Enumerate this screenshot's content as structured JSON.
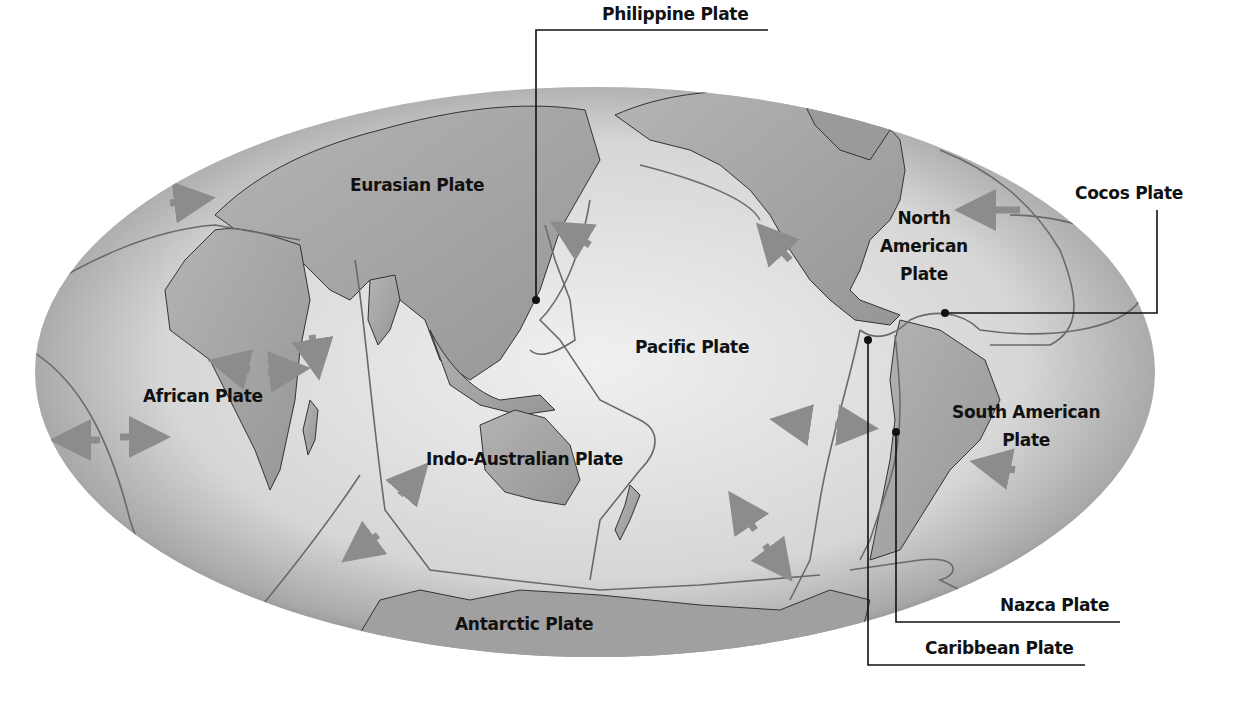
{
  "diagram": {
    "type": "world tectonic plates map",
    "colors": {
      "ocean_light": "#e6e6e6",
      "ocean_edge": "#8a8a8a",
      "land": "#a9a9a9",
      "boundary": "#6a6a6a",
      "arrow": "#8c8c8c",
      "text": "#111111",
      "leader": "#111111"
    },
    "map_labels": [
      {
        "id": "eurasian",
        "text": "Eurasian Plate"
      },
      {
        "id": "north-american",
        "text": "North American Plate",
        "lines": [
          "North",
          "American",
          "Plate"
        ]
      },
      {
        "id": "pacific",
        "text": "Pacific Plate"
      },
      {
        "id": "african",
        "text": "African Plate"
      },
      {
        "id": "indo-australian",
        "text": "Indo-Australian Plate"
      },
      {
        "id": "south-american",
        "text": "South American Plate",
        "lines": [
          "South American",
          "Plate"
        ]
      },
      {
        "id": "antarctic",
        "text": "Antarctic Plate"
      }
    ],
    "callouts": [
      {
        "id": "philippine",
        "text": "Philippine Plate"
      },
      {
        "id": "cocos",
        "text": "Cocos Plate"
      },
      {
        "id": "nazca",
        "text": "Nazca Plate"
      },
      {
        "id": "caribbean",
        "text": "Caribbean Plate"
      }
    ]
  }
}
